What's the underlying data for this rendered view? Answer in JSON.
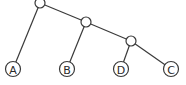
{
  "diagram": {
    "type": "phylogenetic-tree",
    "internal_nodes": [
      {
        "id": "root",
        "x": 40,
        "y": 3
      },
      {
        "id": "n1",
        "x": 86,
        "y": 22
      },
      {
        "id": "n2",
        "x": 131,
        "y": 41
      }
    ],
    "leaves": [
      {
        "id": "A",
        "label": "A",
        "x": 13,
        "y": 69
      },
      {
        "id": "B",
        "label": "B",
        "x": 67,
        "y": 69
      },
      {
        "id": "D",
        "label": "D",
        "x": 121,
        "y": 69
      },
      {
        "id": "C",
        "label": "C",
        "x": 171,
        "y": 69
      }
    ],
    "edges": [
      [
        "root",
        "A"
      ],
      [
        "root",
        "n1"
      ],
      [
        "n1",
        "B"
      ],
      [
        "n1",
        "n2"
      ],
      [
        "n2",
        "D"
      ],
      [
        "n2",
        "C"
      ]
    ],
    "colors": {
      "stroke": "#3a3a3a",
      "fill": "#ffffff",
      "text": "#2a2a2a"
    }
  }
}
